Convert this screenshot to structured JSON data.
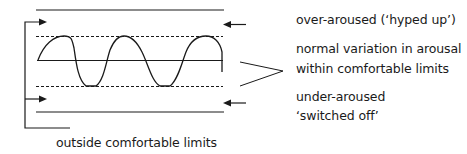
{
  "labels": {
    "over_aroused": "over-aroused (‘hyped up’)",
    "normal_line1": "normal variation in arousal",
    "normal_line2": "within comfortable limits",
    "under_line1": "under-aroused",
    "under_line2": "‘switched off’",
    "outside": "outside comfortable limits"
  },
  "colors": {
    "stroke": "#1a1a1a",
    "background": "#ffffff"
  }
}
